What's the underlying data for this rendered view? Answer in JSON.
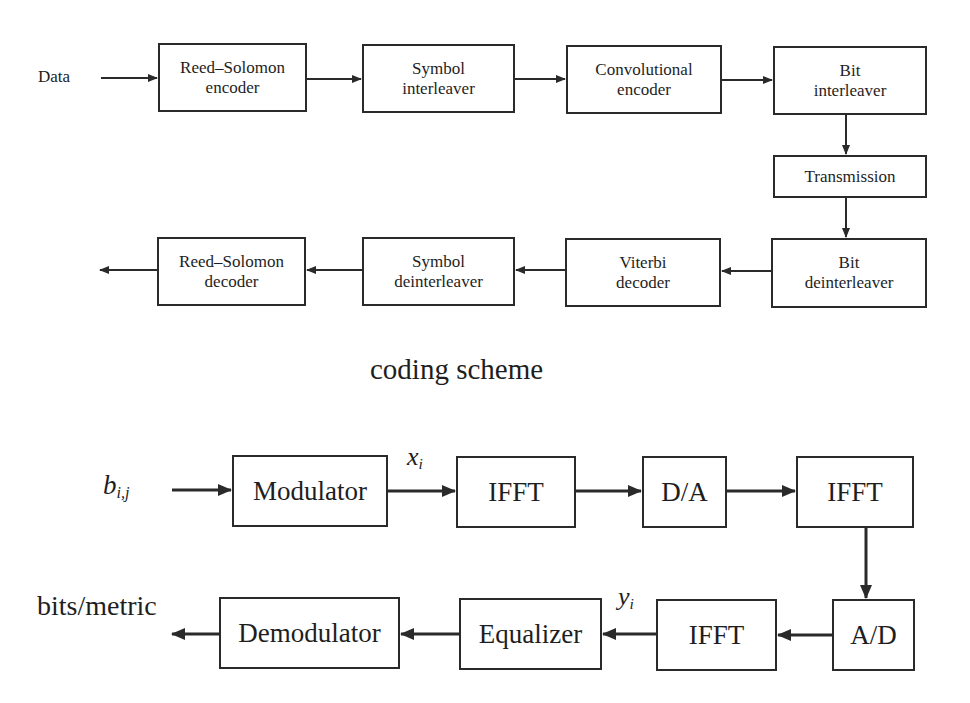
{
  "coding_scheme": {
    "input_label": "Data",
    "transmit_row": [
      {
        "id": "rs-encoder",
        "line1": "Reed–Solomon",
        "line2": "encoder"
      },
      {
        "id": "symbol-interleaver",
        "line1": "Symbol",
        "line2": "interleaver"
      },
      {
        "id": "convolutional-encoder",
        "line1": "Convolutional",
        "line2": "encoder"
      },
      {
        "id": "bit-interleaver",
        "line1": "Bit",
        "line2": "interleaver"
      }
    ],
    "channel": {
      "id": "transmission",
      "label": "Transmission"
    },
    "receive_row": [
      {
        "id": "rs-decoder",
        "line1": "Reed–Solomon",
        "line2": "decoder"
      },
      {
        "id": "symbol-deinterleaver",
        "line1": "Symbol",
        "line2": "deinterleaver"
      },
      {
        "id": "viterbi-decoder",
        "line1": "Viterbi",
        "line2": "decoder"
      },
      {
        "id": "bit-deinterleaver",
        "line1": "Bit",
        "line2": "deinterleaver"
      }
    ],
    "caption": "coding scheme"
  },
  "ofdm_chain": {
    "input_label": {
      "base": "b",
      "sub": "i,j"
    },
    "mod_output_label": {
      "base": "x",
      "sub": "i"
    },
    "ifft_output_label": {
      "base": "y",
      "sub": "i"
    },
    "output_label": "bits/metric",
    "transmit_row": [
      {
        "id": "modulator",
        "label": "Modulator"
      },
      {
        "id": "ifft-1",
        "label": "IFFT"
      },
      {
        "id": "d-a",
        "label": "D/A"
      },
      {
        "id": "ifft-2",
        "label": "IFFT"
      }
    ],
    "receive_row": [
      {
        "id": "demodulator",
        "label": "Demodulator"
      },
      {
        "id": "equalizer",
        "label": "Equalizer"
      },
      {
        "id": "ifft-3",
        "label": "IFFT"
      },
      {
        "id": "a-d",
        "label": "A/D"
      }
    ]
  },
  "colors": {
    "stroke": "#2a2a2a",
    "text": "#1e1e1e",
    "background": "#ffffff"
  }
}
